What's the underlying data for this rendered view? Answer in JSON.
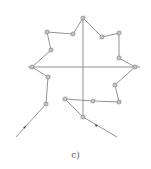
{
  "diagram": {
    "caption": "c)",
    "colors": {
      "line": "#777777",
      "node": "#888888",
      "background": "#ffffff"
    },
    "axes": {
      "horizontal": {
        "x1": 28,
        "y1": 67,
        "x2": 140,
        "y2": 67
      },
      "vertical": {
        "x1": 83,
        "y1": 18,
        "x2": 83,
        "y2": 117
      }
    },
    "polygon_points": [
      [
        83,
        18
      ],
      [
        102,
        37
      ],
      [
        119,
        33
      ],
      [
        119,
        58
      ],
      [
        135,
        67
      ],
      [
        115,
        85
      ],
      [
        119,
        102
      ],
      [
        93,
        101
      ],
      [
        65,
        99
      ],
      [
        83,
        117
      ]
    ],
    "polyline_left": [
      [
        65,
        99
      ],
      [
        83,
        117
      ]
    ],
    "outline_left": [
      [
        46,
        104
      ],
      [
        48,
        77
      ],
      [
        32,
        67
      ],
      [
        51,
        50
      ],
      [
        47,
        32
      ],
      [
        73,
        34
      ],
      [
        83,
        18
      ]
    ],
    "lead_lines": [
      {
        "from": [
          46,
          104
        ],
        "to": [
          16,
          137
        ],
        "arrow_at": [
          24,
          128
        ]
      },
      {
        "from": [
          83,
          117
        ],
        "to": [
          117,
          137
        ],
        "arrow_at": [
          97,
          126
        ]
      }
    ],
    "nodes": [
      [
        83,
        18
      ],
      [
        102,
        37
      ],
      [
        119,
        33
      ],
      [
        119,
        58
      ],
      [
        135,
        67
      ],
      [
        115,
        85
      ],
      [
        119,
        102
      ],
      [
        93,
        101
      ],
      [
        83,
        117
      ],
      [
        65,
        99
      ],
      [
        46,
        104
      ],
      [
        48,
        77
      ],
      [
        32,
        67
      ],
      [
        51,
        50
      ],
      [
        47,
        32
      ],
      [
        73,
        34
      ]
    ]
  }
}
